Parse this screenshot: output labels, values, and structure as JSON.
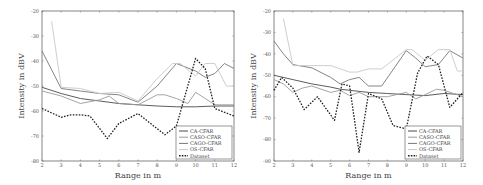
{
  "colors": {
    "ca": "#4a4a4a",
    "caso": "#9a9a9a",
    "cago": "#777777",
    "os": "#c8c8c8",
    "dataset": "#222222",
    "axis": "#666666"
  },
  "chart_data": [
    {
      "type": "line",
      "title": "",
      "xlabel": "Range in m",
      "ylabel": "Intensity in dBV",
      "xlim": [
        2,
        12
      ],
      "ylim": [
        -80,
        -20
      ],
      "xticks": [
        2,
        3,
        4,
        5,
        6,
        7,
        8,
        9,
        10,
        11,
        12
      ],
      "yticks": [
        -20,
        -30,
        -40,
        -50,
        -60,
        -70,
        -80
      ],
      "grid": false,
      "legend_position": "lower right",
      "plot_box": {
        "x0": 42,
        "x1": 234,
        "y0": 11,
        "y1": 161
      },
      "series": [
        {
          "name": "CA-CFAR",
          "key": "ca",
          "style": "solid",
          "x": [
            2,
            3,
            4,
            5,
            6,
            7,
            8,
            9,
            10,
            11,
            12
          ],
          "values": [
            -50.5,
            -53,
            -55,
            -56,
            -57,
            -57.5,
            -58,
            -58.3,
            -58.3,
            -58,
            -58
          ]
        },
        {
          "name": "CASO-CFAR",
          "key": "caso",
          "style": "solid",
          "x": [
            2,
            3,
            4,
            5,
            5.5,
            6,
            7,
            8,
            8.4,
            9,
            9.6,
            10,
            10.5,
            11,
            12
          ],
          "values": [
            -52,
            -54,
            -57,
            -55.5,
            -54,
            -57,
            -57.5,
            -53.5,
            -53.5,
            -55,
            -57,
            -52.5,
            -55,
            -57.5,
            -57.5
          ]
        },
        {
          "name": "CAGO-CFAR",
          "key": "cago",
          "style": "solid",
          "x": [
            2,
            3,
            4,
            5,
            6,
            7,
            8,
            9,
            10,
            10.5,
            11,
            11.5,
            12
          ],
          "values": [
            -36,
            -51,
            -52,
            -53,
            -53.5,
            -56.5,
            -50,
            -41,
            -44,
            -46.5,
            -45,
            -41,
            -43
          ]
        },
        {
          "name": "OS-CFAR",
          "key": "os",
          "style": "solid",
          "x": [
            2.5,
            3,
            4,
            5,
            6,
            7,
            8,
            8.8,
            9.2,
            10,
            10.5,
            11,
            11.6,
            12
          ],
          "values": [
            -24,
            -50.5,
            -51,
            -53,
            -52.5,
            -56,
            -47,
            -41,
            -41,
            -46,
            -41,
            -41,
            -50,
            -50
          ]
        },
        {
          "name": "Dataset",
          "key": "dataset",
          "style": "dashed",
          "x": [
            2,
            3,
            3.5,
            4,
            4.5,
            5.4,
            6,
            7,
            8.4,
            9,
            10,
            10.5,
            11,
            12
          ],
          "values": [
            -59,
            -62.5,
            -61.5,
            -61.5,
            -62,
            -71,
            -65,
            -61,
            -69.5,
            -66,
            -39,
            -43,
            -59,
            -62
          ]
        }
      ]
    },
    {
      "type": "line",
      "title": "",
      "xlabel": "Range in m",
      "ylabel": "Intensity in dBV",
      "xlim": [
        2,
        12
      ],
      "ylim": [
        -90,
        -20
      ],
      "xticks": [
        2,
        3,
        4,
        5,
        6,
        7,
        8,
        9,
        10,
        11,
        12
      ],
      "yticks": [
        -20,
        -30,
        -40,
        -50,
        -60,
        -70,
        -80,
        -90
      ],
      "grid": false,
      "legend_position": "lower right",
      "plot_box": {
        "x0": 274,
        "x1": 463,
        "y0": 11,
        "y1": 161
      },
      "series": [
        {
          "name": "CA-CFAR",
          "key": "ca",
          "style": "solid",
          "x": [
            2,
            3,
            4,
            5,
            5.5,
            6,
            7,
            8,
            9,
            10,
            11,
            12
          ],
          "values": [
            -50,
            -52,
            -54,
            -55.5,
            -56.5,
            -57,
            -58,
            -58.5,
            -59,
            -59.5,
            -58.5,
            -59
          ]
        },
        {
          "name": "CASO-CFAR",
          "key": "caso",
          "style": "solid",
          "x": [
            2,
            2.5,
            3,
            3.5,
            4,
            5,
            5.5,
            6,
            6.5,
            7,
            8,
            9,
            9.5,
            10,
            10.6,
            11,
            12
          ],
          "values": [
            -52,
            -54,
            -58,
            -56,
            -55,
            -58,
            -57,
            -59.5,
            -58,
            -60,
            -60,
            -58,
            -61,
            -59,
            -56.5,
            -57,
            -60
          ]
        },
        {
          "name": "CAGO-CFAR",
          "key": "cago",
          "style": "solid",
          "x": [
            2,
            2.5,
            3,
            4,
            5,
            5.5,
            6,
            6.5,
            7,
            7.7,
            9,
            9.5,
            10,
            10.7,
            11.3,
            12
          ],
          "values": [
            -34,
            -40,
            -45,
            -46.5,
            -51,
            -54,
            -52,
            -51,
            -55,
            -55,
            -38.5,
            -42,
            -46,
            -45,
            -38.5,
            -42
          ]
        },
        {
          "name": "OS-CFAR",
          "key": "os",
          "style": "solid",
          "x": [
            2.5,
            3,
            4,
            5,
            6,
            6.4,
            7,
            7.7,
            9,
            9.3,
            10,
            10.7,
            11.3,
            11.7,
            12
          ],
          "values": [
            -23.5,
            -45.5,
            -45.5,
            -45.5,
            -48.5,
            -48.5,
            -47,
            -47,
            -38,
            -38,
            -43,
            -38,
            -38,
            -48,
            -48
          ]
        },
        {
          "name": "Dataset",
          "key": "dataset",
          "style": "dashed",
          "x": [
            2,
            2.4,
            3,
            3.6,
            4.3,
            5.2,
            5.6,
            6,
            6.5,
            7,
            7.7,
            8.3,
            9,
            9.6,
            10.1,
            10.7,
            11.3,
            12
          ],
          "values": [
            -57,
            -51,
            -56,
            -66,
            -60,
            -71,
            -54,
            -55,
            -86,
            -58.5,
            -61,
            -73.5,
            -75,
            -49,
            -41,
            -45,
            -65,
            -58
          ]
        }
      ]
    }
  ]
}
